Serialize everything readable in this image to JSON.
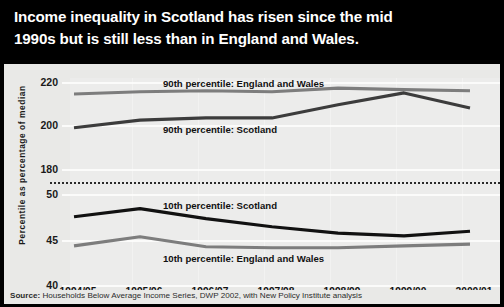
{
  "title": {
    "line1": "Income inequality in Scotland has risen since the mid",
    "line2": "1990s but is still less than in England and Wales."
  },
  "axes": {
    "y_title": "Percentile as percentage of median",
    "y_ticks_upper": [
      "220",
      "200",
      "180"
    ],
    "y_ticks_lower": [
      "50",
      "45",
      "40"
    ],
    "x_ticks": [
      "1994/95",
      "1995/96",
      "1996/97",
      "1997/98",
      "1998/99",
      "1999/00",
      "2000/01"
    ]
  },
  "series_labels": {
    "p90_ew": "90th percentile: England and Wales",
    "p90_sco": "90th percentile: Scotland",
    "p10_sco": "10th percentile: Scotland",
    "p10_ew": "10th percentile: England and Wales"
  },
  "source": {
    "prefix": "Source:",
    "text": " Households Below Average Income Series, DWP 2002, with New Policy Institute analysis"
  },
  "colors": {
    "banner": "#000000",
    "panel": "#e9e9e7",
    "grid": "#fbfbfa",
    "dark_line": "#3c3c3c",
    "black_line": "#111111",
    "grey_line": "#7d7d7d",
    "text": "#141414"
  },
  "chart_data": {
    "type": "line",
    "title": "Income inequality in Scotland has risen since the mid 1990s but is still less than in England and Wales.",
    "xlabel": "",
    "ylabel": "Percentile as percentage of median",
    "x": [
      "1994/95",
      "1995/96",
      "1996/97",
      "1997/98",
      "1998/99",
      "1999/00",
      "2000/01"
    ],
    "broken_axis": true,
    "ylim_upper": [
      180,
      220
    ],
    "ylim_lower": [
      40,
      50
    ],
    "grid": true,
    "legend": "inline-annotations",
    "series": [
      {
        "name": "90th percentile: England and Wales",
        "panel": "upper",
        "color": "#7d7d7d",
        "values": [
          214.5,
          215.5,
          216.0,
          215.5,
          217.2,
          216.5,
          216.0
        ]
      },
      {
        "name": "90th percentile: Scotland",
        "panel": "upper",
        "color": "#3c3c3c",
        "values": [
          199.0,
          202.5,
          203.5,
          203.5,
          209.5,
          215.0,
          208.0
        ]
      },
      {
        "name": "10th percentile: Scotland",
        "panel": "lower",
        "color": "#111111",
        "values": [
          47.5,
          48.4,
          47.3,
          46.4,
          45.7,
          45.4,
          45.9
        ]
      },
      {
        "name": "10th percentile: England and Wales",
        "panel": "lower",
        "color": "#7d7d7d",
        "values": [
          44.3,
          45.3,
          44.2,
          44.1,
          44.1,
          44.3,
          44.5
        ]
      }
    ]
  }
}
